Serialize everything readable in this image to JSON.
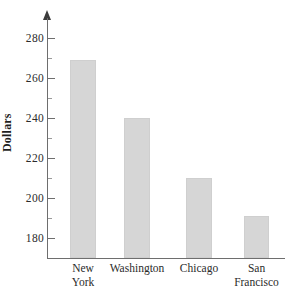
{
  "chart_data": {
    "type": "bar",
    "title": "",
    "subtitle": "",
    "xlabel": "",
    "ylabel": "Dollars",
    "categories": [
      "New York",
      "Washington",
      "Chicago",
      "San Francisco"
    ],
    "category_lines": [
      [
        "New",
        "York"
      ],
      [
        "Washington"
      ],
      [
        "Chicago"
      ],
      [
        "San",
        "Francisco"
      ]
    ],
    "values": [
      269,
      240,
      210,
      191
    ],
    "ylim": [
      178,
      285
    ],
    "y_ticks": [
      180,
      200,
      220,
      240,
      260,
      280
    ],
    "y_tick_labels": [
      "180",
      "200",
      "220",
      "240",
      "260",
      "280"
    ],
    "y_minor_ticks": [
      190,
      210,
      230,
      250,
      270
    ],
    "grid": false,
    "legend": null,
    "bar_color": "#d6d6d6",
    "axis_color": "#6e6e6e",
    "text_color": "#2b2b2b"
  }
}
